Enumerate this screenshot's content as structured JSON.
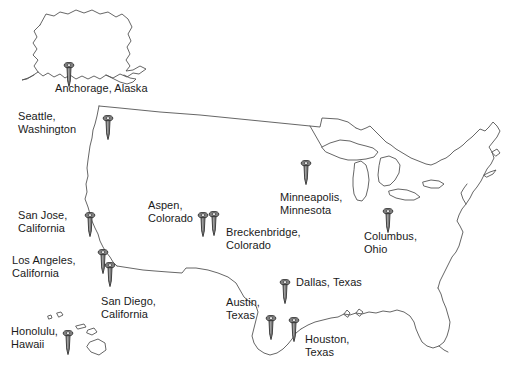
{
  "map": {
    "title": "United States pin map",
    "background_color": "#ffffff",
    "outline_color": "#555555",
    "pin_body_color": "#808080",
    "pin_outline_color": "#333333",
    "label_color": "#1a1a1a"
  },
  "pins": [
    {
      "id": "anchorage-alaska",
      "city": "Anchorage",
      "state": "Alaska",
      "label_lines": [
        "Anchorage, Alaska"
      ],
      "label_align": "left",
      "pin_x": 69,
      "pin_y": 62,
      "label_x": 55,
      "label_y": 82
    },
    {
      "id": "seattle-washington",
      "city": "Seattle",
      "state": "Washington",
      "label_lines": [
        "Seattle,",
        "Washington"
      ],
      "label_align": "left",
      "pin_x": 108,
      "pin_y": 115,
      "label_x": 18,
      "label_y": 110
    },
    {
      "id": "san-jose-california",
      "city": "San Jose",
      "state": "California",
      "label_lines": [
        "San Jose,",
        "California"
      ],
      "label_align": "left",
      "pin_x": 90,
      "pin_y": 212,
      "label_x": 18,
      "label_y": 209
    },
    {
      "id": "los-angeles-california",
      "city": "Los Angeles",
      "state": "California",
      "label_lines": [
        "Los Angeles,",
        "California"
      ],
      "label_align": "left",
      "pin_x": 103,
      "pin_y": 249,
      "label_x": 12,
      "label_y": 254
    },
    {
      "id": "san-diego-california",
      "city": "San Diego",
      "state": "California",
      "label_lines": [
        "San Diego,",
        "California"
      ],
      "label_align": "left",
      "pin_x": 110,
      "pin_y": 262,
      "label_x": 101,
      "label_y": 295
    },
    {
      "id": "honolulu-hawaii",
      "city": "Honolulu",
      "state": "Hawaii",
      "label_lines": [
        "Honolulu,",
        "Hawaii"
      ],
      "label_align": "left",
      "pin_x": 68,
      "pin_y": 330,
      "label_x": 11,
      "label_y": 325
    },
    {
      "id": "aspen-colorado",
      "city": "Aspen",
      "state": "Colorado",
      "label_lines": [
        "Aspen,",
        "Colorado"
      ],
      "label_align": "left",
      "pin_x": 203,
      "pin_y": 212,
      "label_x": 148,
      "label_y": 199
    },
    {
      "id": "breckenbridge-colorado",
      "city": "Breckenbridge",
      "state": "Colorado",
      "label_lines": [
        "Breckenbridge,",
        "Colorado"
      ],
      "label_align": "left",
      "pin_x": 214,
      "pin_y": 211,
      "label_x": 226,
      "label_y": 226
    },
    {
      "id": "minneapolis-minnesota",
      "city": "Minneapolis",
      "state": "Minnesota",
      "label_lines": [
        "Minneapolis,",
        "Minnesota"
      ],
      "label_align": "left",
      "pin_x": 306,
      "pin_y": 160,
      "label_x": 280,
      "label_y": 191
    },
    {
      "id": "columbus-ohio",
      "city": "Columbus",
      "state": "Ohio",
      "label_lines": [
        "Columbus,",
        "Ohio"
      ],
      "label_align": "left",
      "pin_x": 388,
      "pin_y": 208,
      "label_x": 364,
      "label_y": 230
    },
    {
      "id": "dallas-texas",
      "city": "Dallas",
      "state": "Texas",
      "label_lines": [
        "Dallas, Texas"
      ],
      "label_align": "left",
      "pin_x": 285,
      "pin_y": 279,
      "label_x": 296,
      "label_y": 276
    },
    {
      "id": "austin-texas",
      "city": "Austin",
      "state": "Texas",
      "label_lines": [
        "Austin,",
        "Texas"
      ],
      "label_align": "left",
      "pin_x": 271,
      "pin_y": 315,
      "label_x": 226,
      "label_y": 296
    },
    {
      "id": "houston-texas",
      "city": "Houston",
      "state": "Texas",
      "label_lines": [
        "Houston,",
        "Texas"
      ],
      "label_align": "left",
      "pin_x": 294,
      "pin_y": 317,
      "label_x": 305,
      "label_y": 333
    }
  ]
}
